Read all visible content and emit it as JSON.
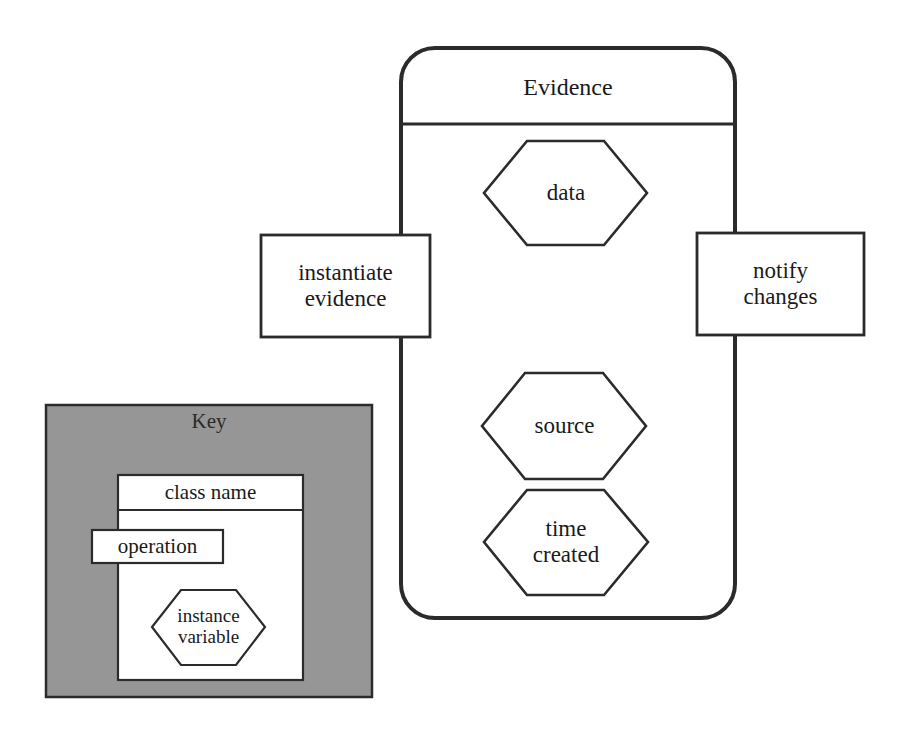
{
  "diagram": {
    "type": "uml-class-diagram",
    "background_color": "#ffffff",
    "stroke_color": "#2b2b2b",
    "key_panel_fill": "#969696",
    "box_fill": "#ffffff",
    "main_class": {
      "name": "Evidence",
      "operations": [
        {
          "label": "instantiate\nevidence",
          "side": "left"
        },
        {
          "label": "notify\nchanges",
          "side": "right"
        }
      ],
      "attributes": [
        {
          "label": "data"
        },
        {
          "label": "source"
        },
        {
          "label": "time\ncreated"
        }
      ]
    },
    "key": {
      "title": "Key",
      "class_name_label": "class name",
      "operation_label": "operation",
      "instance_variable_label": "instance\nvariable"
    }
  }
}
